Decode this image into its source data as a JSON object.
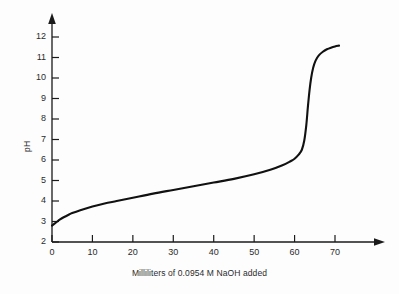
{
  "chart_data": {
    "type": "line",
    "title": "",
    "subtitle": "",
    "xlabel": "Milliliters of 0.0954 M NaOH added",
    "ylabel": "pH",
    "xlim": [
      0,
      76
    ],
    "ylim": [
      2,
      12.6
    ],
    "xticks": [
      0,
      10,
      20,
      30,
      40,
      50,
      60,
      70
    ],
    "yticks": [
      2,
      3,
      4,
      5,
      6,
      7,
      8,
      9,
      10,
      11,
      12
    ],
    "xtick_labels": [
      "0",
      "10",
      "20",
      "30",
      "40",
      "50",
      "60",
      "70"
    ],
    "ytick_labels": [
      "2",
      "3",
      "4",
      "5",
      "6",
      "7",
      "8",
      "9",
      "10",
      "11",
      "12"
    ],
    "grid": false,
    "legend": null,
    "axis_arrows": true,
    "line_color": "#111111",
    "line_width": 2.1,
    "series": [
      {
        "name": "Titration of weak acid with 0.0954 M NaOH",
        "x": [
          0,
          1,
          2,
          3,
          4,
          5,
          7,
          10,
          13,
          16,
          20,
          25,
          30,
          35,
          40,
          45,
          50,
          54,
          57,
          59,
          60,
          61,
          61.8,
          62.4,
          62.9,
          63.3,
          63.7,
          64.1,
          64.6,
          65.2,
          66,
          67,
          68,
          69,
          70,
          71
        ],
        "y": [
          2.8,
          2.95,
          3.1,
          3.22,
          3.32,
          3.41,
          3.55,
          3.73,
          3.88,
          4.0,
          4.16,
          4.36,
          4.54,
          4.72,
          4.9,
          5.08,
          5.3,
          5.52,
          5.74,
          5.94,
          6.06,
          6.26,
          6.5,
          6.95,
          7.7,
          8.6,
          9.4,
          10.0,
          10.5,
          10.85,
          11.1,
          11.28,
          11.4,
          11.48,
          11.54,
          11.58
        ]
      }
    ],
    "annotations": []
  },
  "axes": {
    "y_axis_label": "pH",
    "x_axis_label": "Milliliters of 0.0954 M NaOH added"
  },
  "colors": {
    "background": "#fdfdfd",
    "axis": "#1a1a1a",
    "curve": "#111111",
    "text": "#2b2b2b"
  }
}
